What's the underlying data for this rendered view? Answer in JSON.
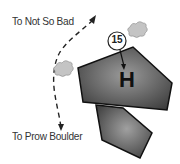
{
  "labels": {
    "top": "To Not So Bad",
    "bottom": "To Prow Boulder"
  },
  "marker": {
    "number": "15",
    "letter": "H"
  },
  "colors": {
    "boulder_dark": "#3a3a3a",
    "boulder_light": "#9a9a9a",
    "bush": "#bdbdbd",
    "text": "#333333"
  }
}
